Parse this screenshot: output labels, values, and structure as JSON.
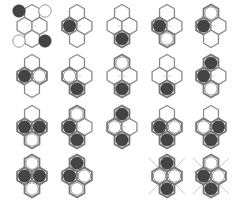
{
  "colors": {
    "hex_border": "#8a8a8a",
    "hex_border_occupied": "#777777",
    "hex_fill": "#ffffff",
    "black_stone": "#444444",
    "white_stone_border": "#9a9a9a",
    "center_line": "#cccccc",
    "cross_line": "#bbbbbb"
  },
  "legend": "Each cluster shows four hex cells: top, left, right, bottom. Cell state: black stone, white stone, or empty.",
  "clusters": [
    {
      "row": 0,
      "col": 0,
      "top": "none",
      "left": "none",
      "right": "none",
      "bottom": "none",
      "corners": {
        "top_left": "black",
        "top_right": "white",
        "bottom_left": "white",
        "bottom_right": "black"
      },
      "crossed": false
    },
    {
      "row": 0,
      "col": 1,
      "top": "none",
      "left": "black",
      "right": "none",
      "bottom": "none",
      "crossed": false
    },
    {
      "row": 0,
      "col": 2,
      "top": "none",
      "left": "none",
      "right": "none",
      "bottom": "black",
      "crossed": false
    },
    {
      "row": 0,
      "col": 3,
      "top": "none",
      "left": "black",
      "right": "none",
      "bottom": "white",
      "crossed": false
    },
    {
      "row": 0,
      "col": 4,
      "top": "white",
      "left": "black",
      "right": "none",
      "bottom": "none",
      "crossed": false
    },
    {
      "row": 1,
      "col": 0,
      "top": "none",
      "left": "black",
      "right": "white",
      "bottom": "none",
      "crossed": false
    },
    {
      "row": 1,
      "col": 1,
      "top": "none",
      "left": "white",
      "right": "none",
      "bottom": "black",
      "crossed": false
    },
    {
      "row": 1,
      "col": 2,
      "top": "white",
      "left": "none",
      "right": "none",
      "bottom": "black",
      "crossed": false
    },
    {
      "row": 1,
      "col": 3,
      "top": "none",
      "left": "none",
      "right": "none",
      "bottom": "black",
      "crossed": false
    },
    {
      "row": 1,
      "col": 4,
      "top": "black",
      "left": "black",
      "right": "none",
      "bottom": "white",
      "crossed": false
    },
    {
      "row": 2,
      "col": 0,
      "top": "none",
      "left": "black",
      "right": "black",
      "bottom": "white",
      "crossed": false
    },
    {
      "row": 2,
      "col": 1,
      "top": "white",
      "left": "black",
      "right": "none",
      "bottom": "black",
      "crossed": false
    },
    {
      "row": 2,
      "col": 2,
      "top": "black",
      "left": "white",
      "right": "none",
      "bottom": "black",
      "crossed": false
    },
    {
      "row": 2,
      "col": 3,
      "top": "none",
      "left": "black",
      "right": "white",
      "bottom": "black",
      "crossed": false
    },
    {
      "row": 2,
      "col": 4,
      "top": "none",
      "left": "white",
      "right": "black",
      "bottom": "black",
      "crossed": false
    },
    {
      "row": 3,
      "col": 0,
      "top": "white",
      "left": "black",
      "right": "black",
      "bottom": "white",
      "crossed": false
    },
    {
      "row": 3,
      "col": 1,
      "top": "black",
      "left": "black",
      "right": "white",
      "bottom": "white",
      "crossed": false
    },
    {
      "row": 3,
      "col": 3,
      "top": "black",
      "left": "white",
      "right": "white",
      "bottom": "black",
      "crossed": true
    },
    {
      "row": 3,
      "col": 4,
      "top": "white",
      "left": "black",
      "right": "white",
      "bottom": "black",
      "crossed": true
    }
  ]
}
